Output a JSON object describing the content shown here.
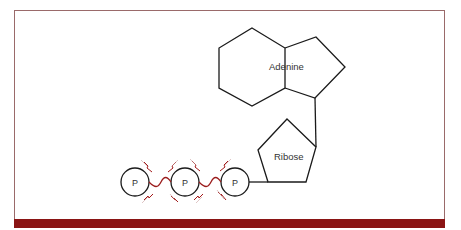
{
  "figure": {
    "labels": {
      "adenine": "Adenine",
      "ribose": "Ribose",
      "phosphates": [
        "P",
        "P",
        "P"
      ]
    },
    "colors": {
      "frame_border": "#9a6a6a",
      "bottom_bar": "#8a1414",
      "high_energy_bond": "#9b1c1c",
      "lines": "#1a1a1a"
    },
    "description_parts": [
      "phosphate-1",
      "phosphate-2",
      "phosphate-3",
      "ribose",
      "adenine"
    ]
  }
}
